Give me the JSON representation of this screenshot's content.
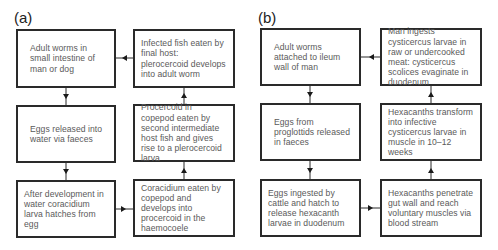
{
  "panels": [
    {
      "label": "(a)",
      "boxes": {
        "top_left": "Adult worms in small intestine of man or dog",
        "top_right": "Infected fish eaten by final host: plerocercoid develops into adult worm",
        "mid_left": "Eggs released into water via faeces",
        "mid_right": "Procercoid in copepod eaten by second intermediate host fish and gives rise to a plerocercoid larva",
        "bottom_left": "After development in water coracidium larva hatches from egg",
        "bottom_right": "Coracidium eaten by copepod and develops into procercoid in the haemocoele"
      }
    },
    {
      "label": "(b)",
      "boxes": {
        "top_left": "Adult worms attached to ileum wall of man",
        "top_right": "Man ingests cysticercus larvae in raw or undercooked meat: cysticercus scolices evaginate in duodenum",
        "mid_left": "Eggs from proglottids released in faeces",
        "mid_right": "Hexacanths transform into infective cysticercus larvae in muscle in 10–12 weeks",
        "bottom_left": "Eggs ingested by cattle and hatch to release hexacanth larvae in duodenum",
        "bottom_right": "Hexacanths penetrate gut wall and reach voluntary muscles via blood stream"
      }
    }
  ],
  "flow": [
    "top_left",
    "mid_left",
    "bottom_left",
    "bottom_right",
    "mid_right",
    "top_right",
    "top_left"
  ],
  "colors": {
    "border": "#2a2a2a",
    "text": "#5a5a5a",
    "arrow": "#1a1a1a"
  }
}
